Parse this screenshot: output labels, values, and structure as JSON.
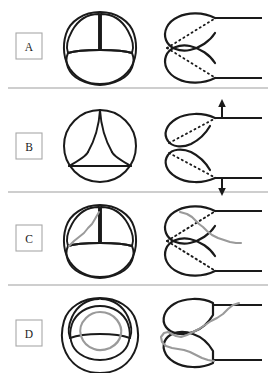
{
  "figure": {
    "width": 274,
    "height": 373,
    "background_color": "#ffffff",
    "ink_color": "#1a1a1a",
    "accent_color": "#9a9a9a",
    "divider_color": "#9e9e9e",
    "label_box_border_color": "#a8a8a8"
  },
  "panels": [
    {
      "id": "panel-a",
      "label": "A",
      "row_index": 0,
      "state": "closed",
      "enface_view": {
        "name": "trileaflet-valve-closed-enface",
        "description": "Three aortic cusps closed, Mercedes-like coaptation lines",
        "cusp_count": 3
      },
      "profile_view": {
        "name": "valve-closed-profile",
        "description": "Two cusps in profile meeting centrally; dotted coaptation lines",
        "dotted_lines": 2,
        "arrows": []
      }
    },
    {
      "id": "panel-b",
      "label": "B",
      "row_index": 1,
      "state": "open",
      "enface_view": {
        "name": "trileaflet-valve-open-enface",
        "description": "Circular annulus with triangular central orifice formed by three opened cusps",
        "cusp_count": 3
      },
      "profile_view": {
        "name": "valve-open-profile",
        "description": "Cusps swung apart against aortic wall; dotted lines; arrows indicating cusp excursion",
        "dotted_lines": 2,
        "arrows": [
          {
            "name": "arrow-up",
            "direction": "up"
          },
          {
            "name": "arrow-down",
            "direction": "down"
          }
        ]
      }
    },
    {
      "id": "panel-c",
      "label": "C",
      "row_index": 2,
      "state": "prolapse",
      "enface_view": {
        "name": "valve-prolapse-enface",
        "description": "Closed trileaflet valve with one cusp marked by an irregular grey line indicating prolapsing redundant tissue",
        "cusp_count": 3,
        "marked_cusp": "left"
      },
      "profile_view": {
        "name": "valve-prolapse-profile",
        "description": "Upper cusp overlaid by irregular grey wavy line extending beyond coaptation point; dotted coaptation lines",
        "dotted_lines": 2,
        "arrows": []
      }
    },
    {
      "id": "panel-d",
      "label": "D",
      "row_index": 3,
      "state": "vegetation",
      "enface_view": {
        "name": "valve-vegetation-enface",
        "description": "Valve with a closed irregular grey loop in the centre representing a vegetation or mass",
        "cusp_count": 3
      },
      "profile_view": {
        "name": "valve-vegetation-profile",
        "description": "Both cusps in profile with an irregular grey serpiginous mass along their free edges",
        "dotted_lines": 0,
        "arrows": []
      }
    }
  ],
  "dividers": [
    {
      "name": "divider-after-panel-a",
      "y": 88
    },
    {
      "name": "divider-after-panel-b",
      "y": 192
    },
    {
      "name": "divider-after-panel-c",
      "y": 285
    }
  ]
}
